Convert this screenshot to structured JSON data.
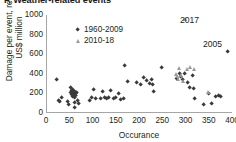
{
  "chart": {
    "title": "F. Weather-related events",
    "xlabel": "Occurance",
    "ylabel_line1": "Damage per event, real",
    "ylabel_line2": "US$ million"
  },
  "legend": {
    "items": [
      {
        "label": "1960-2009",
        "marker": "diamond",
        "color": "#3a3a3a"
      },
      {
        "label": "2010-18",
        "marker": "triangle",
        "color": "#9a9a9a"
      }
    ]
  },
  "annotations": [
    {
      "id": "annot-2017",
      "text": "2017"
    },
    {
      "id": "annot-2005",
      "text": "2005"
    }
  ],
  "axes": {
    "y_ticks": [
      "1000",
      "800",
      "600",
      "400",
      "200",
      "0"
    ],
    "x_ticks": [
      "0",
      "50",
      "100",
      "150",
      "200",
      "250",
      "300",
      "350",
      "400"
    ]
  },
  "chart_data": {
    "type": "scatter",
    "title": "F. Weather-related events",
    "xlabel": "Occurance",
    "ylabel": "Damage per event, real US$ million",
    "xlim": [
      0,
      400
    ],
    "ylim": [
      0,
      1000
    ],
    "xticks": [
      0,
      50,
      100,
      150,
      200,
      250,
      300,
      350,
      400
    ],
    "yticks": [
      0,
      200,
      400,
      600,
      800,
      1000
    ],
    "grid": false,
    "legend_position": "upper-left-inside",
    "annotations": [
      {
        "text": "2017",
        "x": 300,
        "y": 960,
        "series": "2010-18"
      },
      {
        "text": "2005",
        "x": 392,
        "y": 620,
        "series": "1960-2009"
      }
    ],
    "series": [
      {
        "name": "1960-2009",
        "marker": "diamond",
        "color": "#3a3a3a",
        "points": [
          [
            24,
            335
          ],
          [
            28,
            120
          ],
          [
            31,
            105
          ],
          [
            34,
            155
          ],
          [
            47,
            110
          ],
          [
            50,
            75
          ],
          [
            54,
            205
          ],
          [
            55,
            250
          ],
          [
            56,
            185
          ],
          [
            57,
            225
          ],
          [
            58,
            160
          ],
          [
            58,
            200
          ],
          [
            59,
            230
          ],
          [
            60,
            175
          ],
          [
            60,
            210
          ],
          [
            61,
            195
          ],
          [
            62,
            150
          ],
          [
            62,
            215
          ],
          [
            63,
            95
          ],
          [
            64,
            45
          ],
          [
            65,
            190
          ],
          [
            66,
            170
          ],
          [
            68,
            205
          ],
          [
            70,
            115
          ],
          [
            72,
            85
          ],
          [
            95,
            120
          ],
          [
            100,
            145
          ],
          [
            104,
            230
          ],
          [
            108,
            135
          ],
          [
            118,
            140
          ],
          [
            124,
            215
          ],
          [
            128,
            155
          ],
          [
            131,
            140
          ],
          [
            136,
            150
          ],
          [
            140,
            225
          ],
          [
            146,
            140
          ],
          [
            152,
            145
          ],
          [
            158,
            190
          ],
          [
            162,
            130
          ],
          [
            168,
            135
          ],
          [
            170,
            480
          ],
          [
            178,
            310
          ],
          [
            196,
            300
          ],
          [
            206,
            285
          ],
          [
            212,
            350
          ],
          [
            218,
            320
          ],
          [
            224,
            290
          ],
          [
            228,
            330
          ],
          [
            230,
            280
          ],
          [
            232,
            215
          ],
          [
            250,
            455
          ],
          [
            282,
            345
          ],
          [
            288,
            390
          ],
          [
            292,
            365
          ],
          [
            296,
            330
          ],
          [
            300,
            400
          ],
          [
            305,
            300
          ],
          [
            310,
            255
          ],
          [
            316,
            375
          ],
          [
            318,
            240
          ],
          [
            320,
            135
          ],
          [
            340,
            75
          ],
          [
            352,
            195
          ],
          [
            358,
            85
          ],
          [
            366,
            160
          ],
          [
            372,
            170
          ],
          [
            378,
            165
          ],
          [
            392,
            620
          ]
        ]
      },
      {
        "name": "2010-18",
        "marker": "triangle",
        "color": "#9a9a9a",
        "points": [
          [
            280,
            395
          ],
          [
            284,
            370
          ],
          [
            286,
            340
          ],
          [
            288,
            460
          ],
          [
            292,
            385
          ],
          [
            296,
            320
          ],
          [
            300,
            960
          ],
          [
            304,
            440
          ],
          [
            310,
            465
          ],
          [
            320,
            445
          ],
          [
            350,
            215
          ]
        ]
      }
    ]
  }
}
